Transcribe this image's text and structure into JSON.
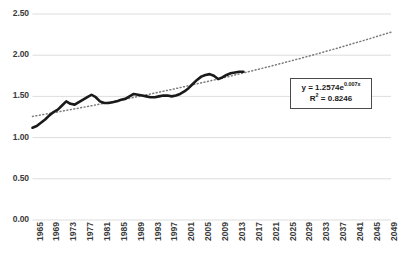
{
  "chart_data": {
    "type": "line",
    "title": "",
    "xlabel": "",
    "ylabel": "",
    "ylim": [
      0.0,
      2.5
    ],
    "xlim": [
      1965,
      2050
    ],
    "grid": true,
    "legend": "none",
    "y_ticks": [
      "0.00",
      "0.50",
      "1.00",
      "1.50",
      "2.00",
      "2.50"
    ],
    "y_tick_values": [
      0.0,
      0.5,
      1.0,
      1.5,
      2.0,
      2.5
    ],
    "x_ticks": [
      "1965",
      "1969",
      "1973",
      "1977",
      "1981",
      "1985",
      "1989",
      "1993",
      "1997",
      "2001",
      "2005",
      "2009",
      "2013",
      "2017",
      "2021",
      "2025",
      "2029",
      "2033",
      "2037",
      "2041",
      "2045",
      "2049"
    ],
    "x_tick_values": [
      1965,
      1969,
      1973,
      1977,
      1981,
      1985,
      1989,
      1993,
      1997,
      2001,
      2005,
      2009,
      2013,
      2017,
      2021,
      2025,
      2029,
      2033,
      2037,
      2041,
      2045,
      2049
    ],
    "series": [
      {
        "name": "observed",
        "style": "solid",
        "color": "#1a1a1a",
        "x": [
          1965,
          1966,
          1967,
          1968,
          1969,
          1970,
          1971,
          1972,
          1973,
          1974,
          1975,
          1976,
          1977,
          1978,
          1979,
          1980,
          1981,
          1982,
          1983,
          1984,
          1985,
          1986,
          1987,
          1988,
          1989,
          1990,
          1991,
          1992,
          1993,
          1994,
          1995,
          1996,
          1997,
          1998,
          1999,
          2000,
          2001,
          2002,
          2003,
          2004,
          2005,
          2006,
          2007,
          2008,
          2009,
          2010,
          2011,
          2012,
          2013,
          2014,
          2015
        ],
        "values": [
          1.12,
          1.14,
          1.18,
          1.22,
          1.27,
          1.31,
          1.34,
          1.39,
          1.44,
          1.41,
          1.4,
          1.43,
          1.46,
          1.49,
          1.52,
          1.49,
          1.44,
          1.42,
          1.42,
          1.43,
          1.44,
          1.46,
          1.47,
          1.5,
          1.53,
          1.52,
          1.51,
          1.5,
          1.49,
          1.49,
          1.5,
          1.51,
          1.51,
          1.5,
          1.51,
          1.53,
          1.56,
          1.6,
          1.65,
          1.7,
          1.74,
          1.76,
          1.77,
          1.75,
          1.71,
          1.73,
          1.76,
          1.78,
          1.79,
          1.8,
          1.8
        ]
      },
      {
        "name": "exponential-trendline",
        "style": "dotted",
        "color": "#7a7a7a",
        "x": [
          1965,
          2050
        ],
        "values": [
          1.27,
          2.25
        ],
        "equation_y_intercept": 1.2574,
        "equation_rate": 0.007,
        "r_squared": 0.8246
      }
    ]
  },
  "annotation": {
    "equation_prefix": "y = 1.2574e",
    "equation_exponent": "0.007x",
    "r_squared_label": "R",
    "r_squared_sup": "2",
    "r_squared_value": " = 0.8246"
  },
  "colors": {
    "background": "#ffffff",
    "gridline": "#d9d9d9",
    "data_line": "#1a1a1a",
    "trendline": "#7a7a7a",
    "axis_text": "#3a3a3a",
    "box_border": "#4a4a4a"
  }
}
